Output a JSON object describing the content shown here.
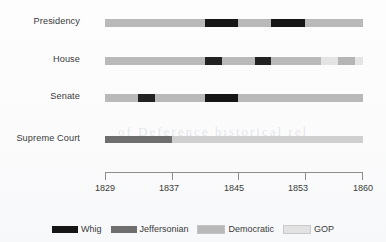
{
  "chart_data": {
    "type": "bar",
    "title": "",
    "subtitle": "",
    "xlabel": "",
    "ylabel": "",
    "orientation": "horizontal-timeline",
    "xlim": [
      1829,
      1860
    ],
    "grid": false,
    "legend_position": "bottom",
    "tick_labels": [
      "1829",
      "1837",
      "1845",
      "1853",
      "1860"
    ],
    "tick_values": [
      1829,
      1837,
      1845,
      1853,
      1860
    ],
    "categories": [
      "Presidency",
      "House",
      "Senate",
      "Supreme Court"
    ],
    "legend": [
      {
        "name": "Whig",
        "color": "#161616"
      },
      {
        "name": "Jeffersonian",
        "color": "#6e6e6e"
      },
      {
        "name": "Democratic",
        "color": "#b9b9b9"
      },
      {
        "name": "GOP",
        "color": "#e2e2e2"
      }
    ],
    "series": [
      {
        "name": "Presidency",
        "segments": [
          {
            "party": "Democratic",
            "start": 1829,
            "end": 1841,
            "color": "#b9b9b9"
          },
          {
            "party": "Whig",
            "start": 1841,
            "end": 1845,
            "color": "#161616"
          },
          {
            "party": "Democratic",
            "start": 1845,
            "end": 1849,
            "color": "#b9b9b9"
          },
          {
            "party": "Whig",
            "start": 1849,
            "end": 1853,
            "color": "#161616"
          },
          {
            "party": "Democratic",
            "start": 1853,
            "end": 1860,
            "color": "#b9b9b9"
          }
        ]
      },
      {
        "name": "House",
        "segments": [
          {
            "party": "Democratic",
            "start": 1829,
            "end": 1841,
            "color": "#b9b9b9"
          },
          {
            "party": "Whig",
            "start": 1841,
            "end": 1843,
            "color": "#222222"
          },
          {
            "party": "Democratic",
            "start": 1843,
            "end": 1847,
            "color": "#b9b9b9"
          },
          {
            "party": "Whig",
            "start": 1847,
            "end": 1849,
            "color": "#222222"
          },
          {
            "party": "Democratic",
            "start": 1849,
            "end": 1855,
            "color": "#b9b9b9"
          },
          {
            "party": "GOP",
            "start": 1855,
            "end": 1857,
            "color": "#e4e4e4"
          },
          {
            "party": "Democratic",
            "start": 1857,
            "end": 1859,
            "color": "#b5b5b5"
          },
          {
            "party": "GOP",
            "start": 1859,
            "end": 1860,
            "color": "#e4e4e4"
          }
        ]
      },
      {
        "name": "Senate",
        "segments": [
          {
            "party": "Democratic",
            "start": 1829,
            "end": 1833,
            "color": "#b9b9b9"
          },
          {
            "party": "Whig",
            "start": 1833,
            "end": 1835,
            "color": "#222222"
          },
          {
            "party": "Democratic",
            "start": 1835,
            "end": 1841,
            "color": "#b9b9b9"
          },
          {
            "party": "Whig",
            "start": 1841,
            "end": 1845,
            "color": "#161616"
          },
          {
            "party": "Democratic",
            "start": 1845,
            "end": 1860,
            "color": "#b9b9b9"
          }
        ]
      },
      {
        "name": "Supreme Court",
        "segments": [
          {
            "party": "Jeffersonian",
            "start": 1829,
            "end": 1837,
            "color": "#6e6e6e"
          },
          {
            "party": "Democratic",
            "start": 1837,
            "end": 1860,
            "color": "#cfcfcf"
          }
        ]
      }
    ]
  },
  "rows": [
    {
      "label": "Presidency",
      "top": 19,
      "label_top": 16
    },
    {
      "label": "House",
      "top": 57,
      "label_top": 54
    },
    {
      "label": "Senate",
      "top": 94,
      "label_top": 91
    },
    {
      "label": "Supreme Court",
      "top": 136,
      "label_top": 133
    }
  ],
  "ghost": {
    "text": "of Deference hıstorical rel"
  }
}
